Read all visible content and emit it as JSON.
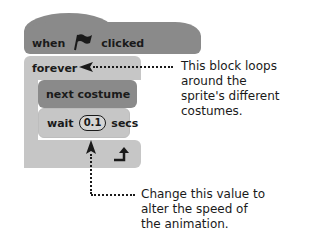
{
  "blocks": {
    "hat": {
      "pre": "when",
      "icon": "green-flag-icon",
      "post": "clicked"
    },
    "forever": {
      "label": "forever"
    },
    "next_costume": {
      "label": "next costume"
    },
    "wait": {
      "pre": "wait",
      "value": "0.1",
      "post": "secs"
    }
  },
  "annotations": {
    "loop": [
      "This block loops",
      "around the",
      "sprite's different",
      "costumes."
    ],
    "value": [
      "Change this value to",
      "alter the speed of",
      "the animation."
    ]
  },
  "colors": {
    "dark_block": "#8a8a8a",
    "light_block": "#c6c6c6",
    "text": "#1a1a1a"
  }
}
